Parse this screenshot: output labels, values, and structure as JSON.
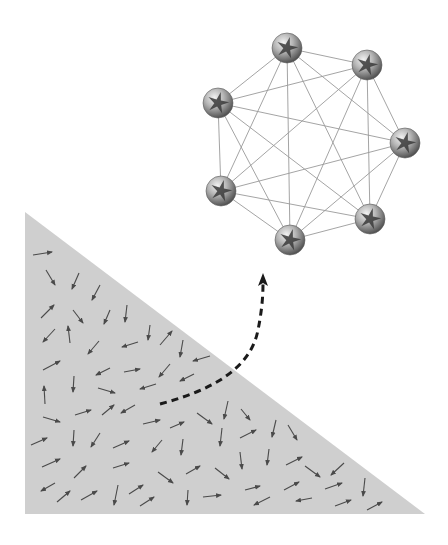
{
  "colors": {
    "background": "#ffffff",
    "region_fill": "#cfcfcf",
    "field_arrow": "#4a4a4a",
    "graph_edge": "#9a9a9a",
    "node_dark": "#5a5a5a",
    "node_light": "#d8d8d8",
    "transition_arrow": "#1a1a1a"
  },
  "region": {
    "shape": "right-triangle",
    "vertices": [
      [
        25,
        212
      ],
      [
        25,
        514
      ],
      [
        425,
        514
      ]
    ]
  },
  "field_arrows": [
    [
      33,
      255,
      52,
      252
    ],
    [
      46,
      270,
      55,
      285
    ],
    [
      79,
      273,
      72,
      289
    ],
    [
      100,
      285,
      92,
      300
    ],
    [
      41,
      318,
      54,
      305
    ],
    [
      73,
      310,
      83,
      323
    ],
    [
      110,
      310,
      104,
      324
    ],
    [
      127,
      305,
      125,
      322
    ],
    [
      55,
      329,
      43,
      342
    ],
    [
      70,
      343,
      68,
      326
    ],
    [
      99,
      341,
      88,
      354
    ],
    [
      138,
      342,
      122,
      347
    ],
    [
      150,
      325,
      148,
      340
    ],
    [
      160,
      345,
      172,
      331
    ],
    [
      183,
      340,
      180,
      357
    ],
    [
      210,
      356,
      193,
      361
    ],
    [
      43,
      370,
      60,
      361
    ],
    [
      110,
      368,
      96,
      375
    ],
    [
      124,
      372,
      140,
      369
    ],
    [
      170,
      364,
      159,
      377
    ],
    [
      74,
      376,
      73,
      392
    ],
    [
      98,
      388,
      115,
      393
    ],
    [
      156,
      384,
      140,
      389
    ],
    [
      194,
      374,
      180,
      381
    ],
    [
      45,
      404,
      44,
      386
    ],
    [
      43,
      417,
      60,
      422
    ],
    [
      75,
      415,
      91,
      410
    ],
    [
      102,
      415,
      114,
      405
    ],
    [
      135,
      405,
      121,
      413
    ],
    [
      143,
      424,
      160,
      420
    ],
    [
      170,
      428,
      184,
      422
    ],
    [
      197,
      413,
      212,
      424
    ],
    [
      228,
      401,
      224,
      419
    ],
    [
      222,
      428,
      220,
      446
    ],
    [
      241,
      409,
      250,
      420
    ],
    [
      240,
      438,
      256,
      430
    ],
    [
      276,
      420,
      272,
      437
    ],
    [
      288,
      425,
      297,
      440
    ],
    [
      31,
      445,
      47,
      438
    ],
    [
      74,
      430,
      73,
      446
    ],
    [
      100,
      433,
      91,
      447
    ],
    [
      113,
      448,
      129,
      441
    ],
    [
      162,
      440,
      152,
      452
    ],
    [
      183,
      439,
      181,
      455
    ],
    [
      240,
      452,
      242,
      469
    ],
    [
      269,
      449,
      267,
      465
    ],
    [
      42,
      467,
      60,
      459
    ],
    [
      74,
      478,
      86,
      466
    ],
    [
      113,
      468,
      129,
      463
    ],
    [
      158,
      472,
      173,
      483
    ],
    [
      186,
      474,
      200,
      466
    ],
    [
      215,
      468,
      229,
      479
    ],
    [
      286,
      465,
      302,
      457
    ],
    [
      305,
      466,
      320,
      477
    ],
    [
      344,
      463,
      331,
      475
    ],
    [
      55,
      483,
      41,
      491
    ],
    [
      57,
      502,
      70,
      491
    ],
    [
      81,
      500,
      97,
      491
    ],
    [
      118,
      485,
      114,
      505
    ],
    [
      129,
      494,
      143,
      485
    ],
    [
      140,
      506,
      154,
      497
    ],
    [
      188,
      490,
      187,
      505
    ],
    [
      203,
      497,
      221,
      495
    ],
    [
      245,
      490,
      260,
      486
    ],
    [
      284,
      490,
      299,
      482
    ],
    [
      270,
      497,
      254,
      505
    ],
    [
      325,
      489,
      342,
      483
    ],
    [
      365,
      478,
      363,
      496
    ],
    [
      312,
      498,
      296,
      501
    ],
    [
      335,
      506,
      351,
      500
    ],
    [
      367,
      510,
      382,
      502
    ]
  ],
  "transition_arrow": {
    "style": "dashed",
    "path": "M160,404 C205,392 250,372 258,330 C263,305 263,290 263,282",
    "tip": [
      263,
      273
    ]
  },
  "graph": {
    "type": "complete-graph",
    "node_count": 7,
    "node_radius": 15,
    "nodes": [
      {
        "id": "n1",
        "x": 287,
        "y": 48
      },
      {
        "id": "n2",
        "x": 367,
        "y": 65
      },
      {
        "id": "n3",
        "x": 218,
        "y": 103
      },
      {
        "id": "n4",
        "x": 405,
        "y": 143
      },
      {
        "id": "n5",
        "x": 221,
        "y": 191
      },
      {
        "id": "n6",
        "x": 370,
        "y": 219
      },
      {
        "id": "n7",
        "x": 290,
        "y": 240
      }
    ]
  }
}
